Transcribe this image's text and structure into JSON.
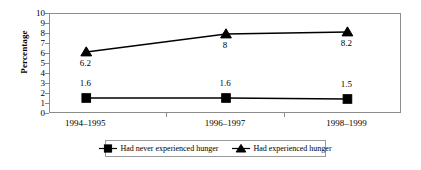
{
  "chart_data": {
    "type": "line",
    "title": "",
    "xlabel": "",
    "ylabel": "Percentage",
    "categories": [
      "1994–1995",
      "1996–1997",
      "1998–1999"
    ],
    "ylim": [
      0,
      10
    ],
    "yticks": [
      0,
      1,
      2,
      3,
      4,
      5,
      6,
      7,
      8,
      9,
      10
    ],
    "ytick_labels": [
      "0",
      "1",
      "2",
      "3",
      "4",
      "5",
      "6",
      "7",
      "8",
      "9",
      "10"
    ],
    "grid": false,
    "legend_position": "bottom",
    "series": [
      {
        "name": "Had never experienced hunger",
        "marker": "square",
        "color": "#000000",
        "values": [
          1.6,
          1.6,
          1.5
        ],
        "data_labels": [
          "1.6",
          "1.6",
          "1.5"
        ],
        "label_position": "above"
      },
      {
        "name": "Had experienced hunger",
        "marker": "triangle",
        "color": "#000000",
        "values": [
          6.2,
          8.0,
          8.2
        ],
        "data_labels": [
          "6.2",
          "8",
          "8.2"
        ],
        "label_position": "below"
      }
    ]
  },
  "axes": {
    "y_title": "Percentage",
    "y_tick_labels": [
      "10",
      "9",
      "8",
      "7",
      "6",
      "5",
      "4",
      "3",
      "2",
      "1",
      "0"
    ],
    "x_tick_labels": [
      "1994–1995",
      "1996–1997",
      "1998–1999"
    ]
  },
  "legend": {
    "entries": [
      {
        "label": "Had never experienced hunger",
        "marker": "square"
      },
      {
        "label": "Had experienced hunger",
        "marker": "triangle"
      }
    ]
  },
  "colors": {
    "series": "#000000",
    "axis": "#8c8c8c",
    "legend_border": "#9a9a9a",
    "background": "#ffffff"
  }
}
